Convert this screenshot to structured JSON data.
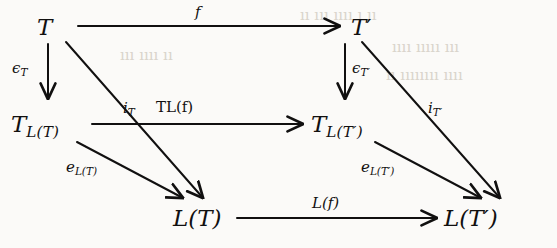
{
  "figure": {
    "kind": "commutative-diagram",
    "background_color": "#fbfaf8",
    "ink_color": "#111010",
    "bleed_color": "#d9d4cb"
  },
  "nodes": {
    "top_left": {
      "base": "T",
      "sub": "",
      "prime": ""
    },
    "top_right": {
      "base": "T",
      "sub": "",
      "prime": "′"
    },
    "mid_left": {
      "base": "T",
      "sub": "L(T)",
      "prime": ""
    },
    "mid_right": {
      "base": "T",
      "sub": "L(T′)",
      "prime": ""
    },
    "bottom_left": {
      "base": "L(T)",
      "sub": "",
      "prime": ""
    },
    "bottom_right": {
      "base": "L(T′)",
      "sub": "",
      "prime": ""
    }
  },
  "arrows": {
    "top_horizontal": {
      "label_base": "f",
      "label_sub": "",
      "from": "top_left",
      "to": "top_right"
    },
    "middle_horizontal": {
      "label_base": "TL(f)",
      "label_sub": "",
      "from": "mid_left",
      "to": "mid_right"
    },
    "bottom_horizontal": {
      "label_base": "L(f)",
      "label_sub": "",
      "from": "bottom_left",
      "to": "bottom_right"
    },
    "left_vertical": {
      "label_base": "ϵ",
      "label_sub": "T",
      "from": "top_left",
      "to": "mid_left"
    },
    "right_vertical": {
      "label_base": "ϵ",
      "label_sub": "T′",
      "from": "top_right",
      "to": "mid_right"
    },
    "left_long_diagonal": {
      "label_base": "i",
      "label_sub": "T",
      "from": "top_left",
      "to": "bottom_left"
    },
    "right_long_diagonal": {
      "label_base": "i",
      "label_sub": "T′",
      "from": "top_right",
      "to": "bottom_right"
    },
    "left_short_diagonal": {
      "label_base": "e",
      "label_sub": "L(T)",
      "from": "mid_left",
      "to": "bottom_left"
    },
    "right_short_diagonal": {
      "label_base": "e",
      "label_sub": "L(T′)",
      "from": "mid_right",
      "to": "bottom_right"
    }
  },
  "bleed_text": {
    "line1": "ıı ııı ıııı ı ıı",
    "line2": "ıııı ııııı ııı",
    "line3": "ıı ıııııııı ıııı",
    "line4": "ııı ıııı ıı"
  }
}
